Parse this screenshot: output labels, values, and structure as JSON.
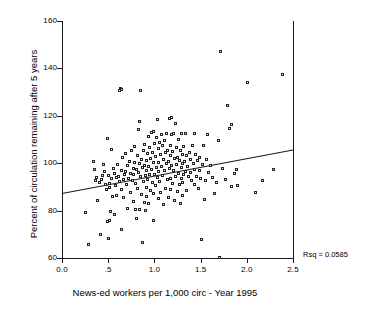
{
  "chart_data": {
    "type": "scatter",
    "title": "",
    "xlabel": "News-ed workers per 1,000 circ - Year 1995",
    "ylabel": "Percent of circulation remaining after 5 years",
    "xlim": [
      0.0,
      2.5
    ],
    "ylim": [
      60,
      160
    ],
    "xticks": [
      0.0,
      0.5,
      1.0,
      1.5,
      2.0,
      2.5
    ],
    "xtick_labels": [
      "0.0",
      ".5",
      "1.0",
      "1.5",
      "2.0",
      "2.5"
    ],
    "yticks": [
      60,
      80,
      100,
      120,
      140,
      160
    ],
    "ytick_labels": [
      "60",
      "80",
      "100",
      "120",
      "140",
      "160"
    ],
    "grid": false,
    "legend": false,
    "marker": "open-square",
    "annotations": [
      {
        "name": "rsq",
        "text": "Rsq = 0.0585"
      }
    ],
    "fit_line": {
      "type": "linear-regression",
      "x": [
        0.0,
        2.5
      ],
      "y": [
        87.2,
        105.6
      ],
      "rsq": 0.0585
    },
    "points": [
      [
        0.27,
        78.6
      ],
      [
        0.3,
        65.3
      ],
      [
        0.35,
        100.2
      ],
      [
        0.36,
        96.9
      ],
      [
        0.37,
        92.1
      ],
      [
        0.38,
        93.6
      ],
      [
        0.4,
        84.0
      ],
      [
        0.42,
        91.3
      ],
      [
        0.43,
        69.3
      ],
      [
        0.44,
        92.5
      ],
      [
        0.45,
        94.5
      ],
      [
        0.46,
        99.2
      ],
      [
        0.47,
        96.2
      ],
      [
        0.48,
        90.4
      ],
      [
        0.49,
        88.5
      ],
      [
        0.5,
        109.8
      ],
      [
        0.5,
        75.0
      ],
      [
        0.51,
        67.6
      ],
      [
        0.51,
        94.3
      ],
      [
        0.52,
        75.6
      ],
      [
        0.52,
        89.2
      ],
      [
        0.53,
        91.2
      ],
      [
        0.54,
        79.3
      ],
      [
        0.55,
        105.3
      ],
      [
        0.55,
        93.0
      ],
      [
        0.56,
        85.4
      ],
      [
        0.57,
        97.5
      ],
      [
        0.58,
        95.1
      ],
      [
        0.58,
        77.9
      ],
      [
        0.59,
        90.0
      ],
      [
        0.6,
        93.4
      ],
      [
        0.6,
        86.0
      ],
      [
        0.61,
        99.0
      ],
      [
        0.62,
        94.0
      ],
      [
        0.63,
        91.8
      ],
      [
        0.63,
        130.2
      ],
      [
        0.64,
        131.0
      ],
      [
        0.65,
        130.8
      ],
      [
        0.65,
        96.5
      ],
      [
        0.66,
        88.3
      ],
      [
        0.66,
        71.4
      ],
      [
        0.67,
        101.8
      ],
      [
        0.68,
        92.9
      ],
      [
        0.68,
        85.2
      ],
      [
        0.69,
        94.6
      ],
      [
        0.7,
        103.5
      ],
      [
        0.7,
        96.0
      ],
      [
        0.71,
        90.7
      ],
      [
        0.72,
        98.4
      ],
      [
        0.72,
        80.5
      ],
      [
        0.73,
        93.2
      ],
      [
        0.74,
        100.5
      ],
      [
        0.75,
        95.4
      ],
      [
        0.75,
        87.1
      ],
      [
        0.76,
        104.8
      ],
      [
        0.77,
        92.3
      ],
      [
        0.78,
        97.2
      ],
      [
        0.78,
        83.6
      ],
      [
        0.79,
        94.9
      ],
      [
        0.8,
        106.6
      ],
      [
        0.8,
        99.7
      ],
      [
        0.81,
        91.0
      ],
      [
        0.81,
        80.2
      ],
      [
        0.82,
        96.8
      ],
      [
        0.82,
        76.3
      ],
      [
        0.83,
        103.0
      ],
      [
        0.83,
        88.9
      ],
      [
        0.84,
        114.0
      ],
      [
        0.84,
        95.6
      ],
      [
        0.85,
        117.0
      ],
      [
        0.85,
        99.3
      ],
      [
        0.85,
        80.0
      ],
      [
        0.86,
        130.3
      ],
      [
        0.86,
        93.8
      ],
      [
        0.87,
        101.2
      ],
      [
        0.87,
        86.4
      ],
      [
        0.88,
        97.8
      ],
      [
        0.88,
        66.2
      ],
      [
        0.89,
        105.0
      ],
      [
        0.89,
        92.0
      ],
      [
        0.9,
        107.4
      ],
      [
        0.9,
        98.6
      ],
      [
        0.9,
        83.0
      ],
      [
        0.91,
        94.2
      ],
      [
        0.91,
        79.8
      ],
      [
        0.92,
        100.9
      ],
      [
        0.92,
        89.5
      ],
      [
        0.93,
        96.3
      ],
      [
        0.93,
        85.7
      ],
      [
        0.94,
        103.7
      ],
      [
        0.94,
        92.7
      ],
      [
        0.95,
        111.0
      ],
      [
        0.95,
        98.0
      ],
      [
        0.95,
        82.4
      ],
      [
        0.96,
        106.2
      ],
      [
        0.96,
        94.8
      ],
      [
        0.97,
        101.5
      ],
      [
        0.97,
        88.1
      ],
      [
        0.98,
        112.6
      ],
      [
        0.98,
        97.0
      ],
      [
        0.99,
        104.3
      ],
      [
        0.99,
        91.5
      ],
      [
        1.0,
        113.0
      ],
      [
        1.0,
        99.9
      ],
      [
        1.0,
        86.8
      ],
      [
        1.0,
        75.2
      ],
      [
        1.01,
        107.8
      ],
      [
        1.01,
        95.0
      ],
      [
        1.02,
        102.4
      ],
      [
        1.02,
        90.2
      ],
      [
        1.03,
        110.4
      ],
      [
        1.03,
        97.6
      ],
      [
        1.04,
        118.0
      ],
      [
        1.04,
        93.5
      ],
      [
        1.05,
        105.6
      ],
      [
        1.05,
        84.5
      ],
      [
        1.06,
        100.0
      ],
      [
        1.06,
        96.1
      ],
      [
        1.07,
        108.2
      ],
      [
        1.07,
        91.9
      ],
      [
        1.08,
        103.3
      ],
      [
        1.08,
        87.4
      ],
      [
        1.09,
        111.7
      ],
      [
        1.09,
        98.3
      ],
      [
        1.1,
        106.9
      ],
      [
        1.1,
        94.4
      ],
      [
        1.11,
        101.0
      ],
      [
        1.11,
        82.0
      ],
      [
        1.12,
        109.1
      ],
      [
        1.12,
        96.6
      ],
      [
        1.13,
        104.0
      ],
      [
        1.13,
        89.0
      ],
      [
        1.14,
        112.2
      ],
      [
        1.14,
        99.5
      ],
      [
        1.15,
        105.1
      ],
      [
        1.15,
        92.6
      ],
      [
        1.16,
        100.3
      ],
      [
        1.16,
        85.0
      ],
      [
        1.17,
        118.6
      ],
      [
        1.17,
        97.3
      ],
      [
        1.18,
        107.0
      ],
      [
        1.18,
        93.1
      ],
      [
        1.19,
        102.7
      ],
      [
        1.19,
        88.6
      ],
      [
        1.2,
        119.0
      ],
      [
        1.2,
        111.8
      ],
      [
        1.2,
        98.8
      ],
      [
        1.21,
        104.5
      ],
      [
        1.21,
        91.1
      ],
      [
        1.22,
        112.0
      ],
      [
        1.22,
        96.4
      ],
      [
        1.23,
        101.6
      ],
      [
        1.23,
        83.8
      ],
      [
        1.24,
        116.5
      ],
      [
        1.24,
        94.1
      ],
      [
        1.25,
        106.0
      ],
      [
        1.25,
        99.1
      ],
      [
        1.26,
        102.0
      ],
      [
        1.26,
        87.7
      ],
      [
        1.27,
        109.6
      ],
      [
        1.27,
        95.3
      ],
      [
        1.28,
        100.7
      ],
      [
        1.28,
        90.8
      ],
      [
        1.29,
        104.9
      ],
      [
        1.29,
        82.6
      ],
      [
        1.3,
        111.9
      ],
      [
        1.3,
        97.9
      ],
      [
        1.3,
        93.3
      ],
      [
        1.31,
        103.1
      ],
      [
        1.31,
        86.1
      ],
      [
        1.32,
        99.4
      ],
      [
        1.32,
        91.6
      ],
      [
        1.33,
        106.5
      ],
      [
        1.33,
        94.7
      ],
      [
        1.34,
        100.1
      ],
      [
        1.35,
        112.1
      ],
      [
        1.35,
        96.0
      ],
      [
        1.36,
        102.9
      ],
      [
        1.36,
        88.2
      ],
      [
        1.37,
        98.2
      ],
      [
        1.38,
        93.9
      ],
      [
        1.39,
        104.2
      ],
      [
        1.4,
        101.3
      ],
      [
        1.4,
        95.8
      ],
      [
        1.41,
        92.4
      ],
      [
        1.42,
        107.2
      ],
      [
        1.43,
        99.6
      ],
      [
        1.44,
        90.5
      ],
      [
        1.45,
        112.0
      ],
      [
        1.45,
        97.1
      ],
      [
        1.46,
        103.4
      ],
      [
        1.47,
        94.0
      ],
      [
        1.48,
        100.6
      ],
      [
        1.49,
        88.7
      ],
      [
        1.5,
        102.1
      ],
      [
        1.5,
        96.7
      ],
      [
        1.51,
        93.0
      ],
      [
        1.52,
        67.4
      ],
      [
        1.53,
        98.9
      ],
      [
        1.54,
        107.0
      ],
      [
        1.55,
        84.2
      ],
      [
        1.56,
        92.2
      ],
      [
        1.58,
        101.1
      ],
      [
        1.59,
        111.5
      ],
      [
        1.6,
        95.5
      ],
      [
        1.62,
        98.5
      ],
      [
        1.64,
        93.7
      ],
      [
        1.66,
        86.6
      ],
      [
        1.68,
        91.4
      ],
      [
        1.7,
        109.3
      ],
      [
        1.72,
        59.9
      ],
      [
        1.73,
        146.5
      ],
      [
        1.75,
        97.4
      ],
      [
        1.78,
        92.8
      ],
      [
        1.8,
        124.0
      ],
      [
        1.82,
        114.2
      ],
      [
        1.84,
        89.8
      ],
      [
        1.85,
        116.0
      ],
      [
        1.88,
        95.2
      ],
      [
        1.9,
        97.0
      ],
      [
        1.91,
        90.3
      ],
      [
        2.02,
        133.6
      ],
      [
        2.1,
        87.3
      ],
      [
        2.18,
        92.4
      ],
      [
        2.3,
        97.1
      ],
      [
        2.4,
        137.0
      ]
    ]
  }
}
